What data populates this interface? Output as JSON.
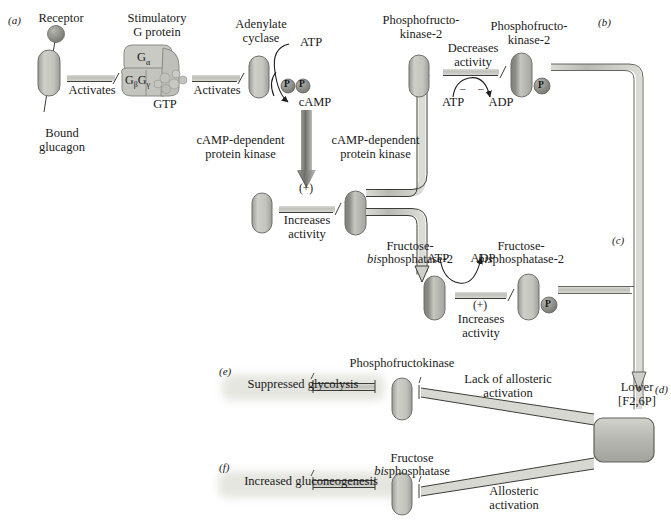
{
  "figure": {
    "type": "biochemical-pathway-diagram"
  },
  "panels": {
    "a": "(a)",
    "b": "(b)",
    "c": "(c)",
    "d": "(d)",
    "e": "(e)",
    "f": "(f)"
  },
  "panel_a": {
    "receptor_label": "Receptor",
    "bound_ligand_label": "Bound\nglucagon",
    "g_protein_label": "Stimulatory\nG protein",
    "g_alpha": "G",
    "g_alpha_sub": "α",
    "g_beta": "G",
    "g_beta_sub": "β",
    "g_gamma": "G",
    "g_gamma_sub": "γ",
    "gtp_label": "GTP",
    "activates_1": "Activates",
    "activates_2": "Activates",
    "adenylate_cyclase_label": "Adenylate\ncyclase",
    "atp_label": "ATP",
    "camp_label": "cAMP",
    "phosphate_1": "P",
    "phosphate_2": "P",
    "kinase_arrow_label_left": "cAMP-dependent\nprotein kinase",
    "kinase_arrow_label_right": "cAMP-dependent\nprotein kinase"
  },
  "panel_kinase": {
    "plus_sign": "(+)",
    "increases_activity": "Increases\nactivity"
  },
  "panel_b": {
    "substrate_label": "Phosphofructo-\nkinase-2",
    "product_label": "Phosphofructo-\nkinase-2",
    "effect_label": "Decreases\nactivity",
    "atp_label": "ATP",
    "adp_label": "ADP",
    "minus_1": "–",
    "minus_2": "–",
    "phosphate": "P"
  },
  "panel_c": {
    "substrate_label": "Fructose-\nbisphosphatase-2",
    "substrate_italic_prefix": "bis",
    "product_label": "Fructose-\nbisphosphatase-2",
    "atp_label": "ATP",
    "adp_label": "ADP",
    "plus_sign": "(+)",
    "increases_activity": "Increases\nactivity",
    "phosphate": "P"
  },
  "panel_d": {
    "outcome_label": "Lower\n[F2,6P]"
  },
  "panel_e": {
    "enzyme_label": "Phosphofructokinase",
    "outcome_label": "Suppressed glycolysis",
    "effect_label": "Lack of allosteric\nactivation"
  },
  "panel_f": {
    "enzyme_label": "Fructose\nbisphosphatase",
    "enzyme_italic_prefix": "bis",
    "outcome_label": "Increased gluconeogenesis",
    "effect_label": "Allosteric\nactivation"
  },
  "colors": {
    "protein_light": "#c9c9c4",
    "protein_mid": "#a8a8a2",
    "protein_dark": "#8f8f8a",
    "band": "#bdbdb8",
    "arrow_dark": "#6e6e6a",
    "highlight": "#e4e4df",
    "text": "#1a1a1a",
    "outline": "#6a6a66"
  }
}
